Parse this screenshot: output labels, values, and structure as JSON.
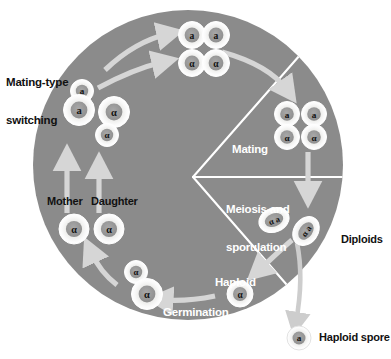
{
  "figure": {
    "type": "diagram",
    "colors": {
      "background": "#ffffff",
      "circle_fill": "#8b8b8b",
      "sector_divider": "#ffffff",
      "arrow": "#d6d6d6",
      "cell_fill": "#f0f0ef",
      "cell_ring": "#ffffff",
      "nucleus_fill": "#9a9a9a",
      "label_dark": "#111111",
      "label_light": "#ffffff"
    }
  },
  "labels": {
    "mating_type_switching_line1": "Mating-type",
    "mating_type_switching_line2": "switching",
    "mother": "Mother",
    "daughter": "Daughter",
    "mating": "Mating",
    "meiosis_line1": "Meiosis and",
    "meiosis_line2": "sporulation",
    "diploids": "Diploids",
    "haploid_spore_inner_line1": "Haploid",
    "haploid_spore_inner_line2": "spore",
    "germination": "Germination",
    "haploid_spore_legend": "Haploid spore"
  },
  "cells": {
    "mating_type_switching_cluster": [
      {
        "id": "bud-a-top",
        "type": "a",
        "size": "small"
      },
      {
        "id": "mother-a",
        "type": "a",
        "size": "large"
      },
      {
        "id": "mother-alpha",
        "type": "α",
        "size": "large"
      },
      {
        "id": "bud-alpha-bottom",
        "type": "α",
        "size": "small"
      }
    ],
    "haploid_grid_top": [
      {
        "id": "grid-a-left",
        "type": "a"
      },
      {
        "id": "grid-a-right",
        "type": "a"
      },
      {
        "id": "grid-alpha-left",
        "type": "α"
      },
      {
        "id": "grid-alpha-right",
        "type": "α"
      }
    ],
    "mating_pairs": [
      {
        "id": "pair1-a",
        "type": "a"
      },
      {
        "id": "pair1-alpha",
        "type": "α"
      },
      {
        "id": "pair2-a",
        "type": "a"
      },
      {
        "id": "pair2-alpha",
        "type": "α"
      }
    ],
    "diploid_cells": [
      {
        "id": "diploid-1",
        "type": "α a"
      },
      {
        "id": "diploid-2",
        "type": "α a"
      }
    ],
    "haploid_spore_inner": {
      "id": "spore-alpha",
      "type": "α"
    },
    "germination_cluster": [
      {
        "id": "germ-bud-alpha",
        "type": "α",
        "size": "small"
      },
      {
        "id": "germ-mother-alpha",
        "type": "α",
        "size": "large"
      }
    ],
    "mother_daughter": [
      {
        "id": "mother-cell",
        "type": "α",
        "label": "Mother"
      },
      {
        "id": "daughter-cell",
        "type": "α",
        "label": "Daughter"
      }
    ],
    "legend_spore": {
      "id": "legend-spore-a",
      "type": "a"
    }
  },
  "sectors": [
    {
      "name": "mating",
      "label": "Mating"
    },
    {
      "name": "meiosis-sporulation",
      "label": "Meiosis and sporulation"
    }
  ],
  "process_steps": [
    "Mating-type switching",
    "Mating",
    "Meiosis and sporulation",
    "Germination"
  ]
}
